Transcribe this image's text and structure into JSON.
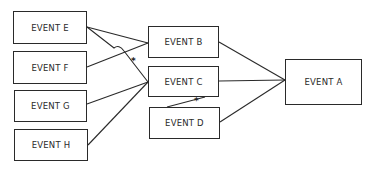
{
  "diagram": {
    "type": "event-tree",
    "nodes": [
      {
        "id": "E",
        "label": "EVENT E",
        "x": 13,
        "y": 11,
        "w": 74,
        "h": 33
      },
      {
        "id": "F",
        "label": "EVENT F",
        "x": 13,
        "y": 51,
        "w": 74,
        "h": 33
      },
      {
        "id": "G",
        "label": "EVENT G",
        "x": 14,
        "y": 90,
        "w": 73,
        "h": 32
      },
      {
        "id": "H",
        "label": "EVENT H",
        "x": 14,
        "y": 129,
        "w": 74,
        "h": 32
      },
      {
        "id": "B",
        "label": "EVENT B",
        "x": 148,
        "y": 26,
        "w": 71,
        "h": 32
      },
      {
        "id": "C",
        "label": "EVENT C",
        "x": 148,
        "y": 66,
        "w": 71,
        "h": 31
      },
      {
        "id": "D",
        "label": "EVENT D",
        "x": 149,
        "y": 107,
        "w": 71,
        "h": 32
      },
      {
        "id": "A",
        "label": "EVENT A",
        "x": 285,
        "y": 59,
        "w": 77,
        "h": 46
      }
    ],
    "edges": [
      {
        "from": "E",
        "to": "B"
      },
      {
        "from": "E",
        "to": "C",
        "crosses_with_hop": true
      },
      {
        "from": "F",
        "to": "B"
      },
      {
        "from": "G",
        "to": "C"
      },
      {
        "from": "H",
        "to": "C"
      },
      {
        "from": "B",
        "to": "A"
      },
      {
        "from": "C",
        "to": "A"
      },
      {
        "from": "D",
        "to": "A"
      },
      {
        "from": "D",
        "to": "C"
      }
    ],
    "markers": [
      {
        "symbol": "*",
        "x": 131,
        "y": 57
      },
      {
        "symbol": "*",
        "x": 194,
        "y": 97
      }
    ],
    "colors": {
      "line": "#2a2a2a",
      "text": "#2b2b2b",
      "background": "#ffffff"
    }
  }
}
